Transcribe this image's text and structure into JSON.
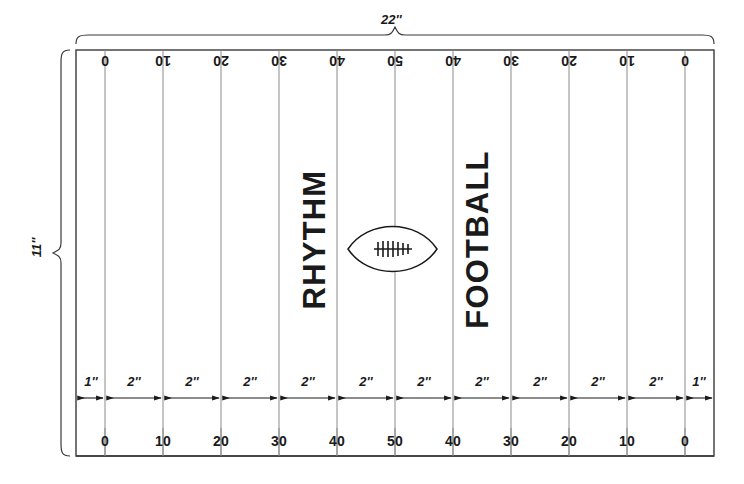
{
  "diagram": {
    "colors": {
      "ink": "#1a1a1a",
      "line": "#3a3a3a",
      "yard_line": "#777777",
      "background": "#ffffff"
    },
    "overall": {
      "width_label": "22''",
      "height_label": "11''"
    },
    "field": {
      "word_left": "RHYTHM",
      "word_right": "FOOTBALL",
      "ball": "football-icon"
    },
    "yard_numbers_top": [
      "0",
      "10",
      "20",
      "30",
      "40",
      "50",
      "40",
      "30",
      "20",
      "10",
      "0"
    ],
    "yard_numbers_bottom": [
      "0",
      "10",
      "20",
      "30",
      "40",
      "50",
      "40",
      "30",
      "20",
      "10",
      "0"
    ],
    "segment_dimensions": [
      "1''",
      "2''",
      "2''",
      "2''",
      "2''",
      "2''",
      "2''",
      "2''",
      "2''",
      "2''",
      "2''",
      "1''"
    ]
  }
}
